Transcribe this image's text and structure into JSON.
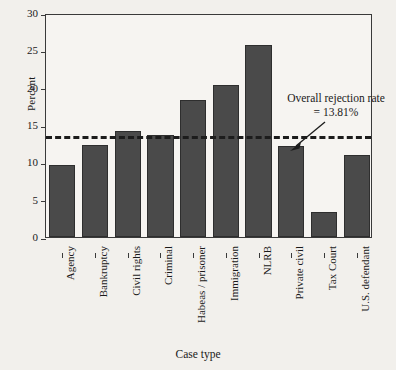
{
  "chart_data": {
    "type": "bar",
    "title": "",
    "xlabel": "Case type",
    "ylabel": "Percent",
    "ylim": [
      0,
      30
    ],
    "yticks": [
      0,
      5,
      10,
      15,
      20,
      25,
      30
    ],
    "grid": false,
    "legend": null,
    "categories": [
      "Agency",
      "Bankruptcy",
      "Civil rights",
      "Criminal",
      "Habeas / prisoner",
      "Immigration",
      "NLRB",
      "Private civil",
      "Tax Court",
      "U.S. defendant"
    ],
    "values": [
      9.6,
      12.3,
      14.2,
      13.7,
      18.3,
      20.3,
      25.7,
      12.2,
      3.3,
      11.0
    ],
    "reference_line": {
      "value": 13.81,
      "style": "dashed",
      "label_line1": "Overall rejection rate",
      "label_line2": "= 13.81%"
    },
    "bar_color": "#4a4a4a",
    "axis_color": "#3a3a3a",
    "background_color": "#f2f0ec"
  }
}
